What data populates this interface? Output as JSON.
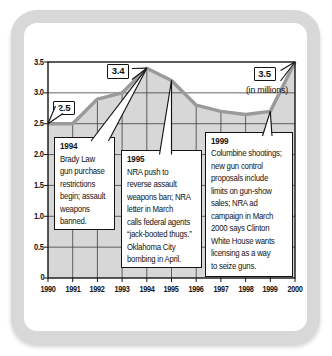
{
  "colors": {
    "line": "#9a9a9a",
    "fill": "#d7d7d7",
    "frame": "#141414",
    "grid": "#3d3d3d",
    "card_ring": "#d8d8d8"
  },
  "chart_data": {
    "type": "area",
    "title": "",
    "unit_label": "(in millions)",
    "categories": [
      "1990",
      "1991",
      "1992",
      "1993",
      "1994",
      "1995",
      "1996",
      "1997",
      "1998",
      "1999",
      "2000"
    ],
    "values": [
      2.5,
      2.5,
      2.9,
      3.0,
      3.4,
      3.2,
      2.8,
      2.7,
      2.65,
      2.7,
      3.5
    ],
    "ylim": [
      0,
      3.5
    ],
    "ytick_labels": [
      "3.5",
      "3.0",
      "2.5",
      "2.0",
      "1.5",
      "1.0",
      "0.5",
      "0"
    ],
    "legend": "none",
    "grid": "horizontal gridlines full width; vertical year gridlines only inside shaded area",
    "callouts": [
      {
        "label": "2.5",
        "year": "1990"
      },
      {
        "label": "3.4",
        "year": "1994"
      },
      {
        "label": "3.5",
        "year": "2000"
      }
    ],
    "annotations": [
      {
        "title": "1994",
        "lines": [
          "Brady Law",
          "gun purchase",
          "restrictions",
          "begin; assault",
          "weapons",
          "banned."
        ]
      },
      {
        "title": "1995",
        "lines": [
          "NRA push to",
          "reverse assault",
          "weapons ban; NRA",
          "letter in March",
          "calls federal agents",
          "“jack-booted thugs.”",
          "Oklahoma City",
          "bombing in April."
        ]
      },
      {
        "title": "1999",
        "lines": [
          "Columbine shootings;",
          "new gun control",
          "proposals include",
          "limits on gun-show",
          "sales; NRA ad",
          "campaign in March",
          "2000 says Clinton",
          "White House wants",
          "licensing as a way",
          "to seize guns."
        ]
      }
    ]
  }
}
